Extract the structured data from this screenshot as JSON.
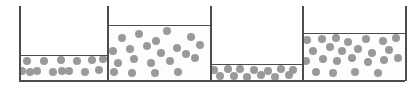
{
  "figure": {
    "title": "",
    "width": 418,
    "height": 88,
    "background_color": "#ffffff",
    "line_color": "#4d4d4d",
    "particle_color": "#9a9a9a",
    "particle_diameter": 8,
    "baseline_y": 80,
    "top_y": 6
  },
  "containers": [
    {
      "label": "container-1",
      "index": 1,
      "left_x": 19,
      "right_x": 107,
      "fill_level_y": 55,
      "fill_fraction": 0.34,
      "particle_count": 14,
      "particles": [
        {
          "x": 27,
          "y": 60
        },
        {
          "x": 44,
          "y": 60
        },
        {
          "x": 61,
          "y": 59
        },
        {
          "x": 77,
          "y": 60
        },
        {
          "x": 92,
          "y": 59
        },
        {
          "x": 103,
          "y": 58
        },
        {
          "x": 22,
          "y": 70
        },
        {
          "x": 37,
          "y": 70
        },
        {
          "x": 53,
          "y": 71
        },
        {
          "x": 69,
          "y": 70
        },
        {
          "x": 85,
          "y": 71
        },
        {
          "x": 99,
          "y": 69
        },
        {
          "x": 62,
          "y": 70
        },
        {
          "x": 30,
          "y": 71
        }
      ]
    },
    {
      "label": "container-2",
      "index": 2,
      "left_x": 107,
      "right_x": 210,
      "fill_level_y": 25,
      "fill_fraction": 0.68,
      "particle_count": 21,
      "particles": [
        {
          "x": 122,
          "y": 37
        },
        {
          "x": 139,
          "y": 33
        },
        {
          "x": 156,
          "y": 40
        },
        {
          "x": 167,
          "y": 30
        },
        {
          "x": 191,
          "y": 36
        },
        {
          "x": 200,
          "y": 44
        },
        {
          "x": 113,
          "y": 50
        },
        {
          "x": 130,
          "y": 48
        },
        {
          "x": 147,
          "y": 45
        },
        {
          "x": 161,
          "y": 52
        },
        {
          "x": 177,
          "y": 47
        },
        {
          "x": 195,
          "y": 57
        },
        {
          "x": 118,
          "y": 62
        },
        {
          "x": 134,
          "y": 58
        },
        {
          "x": 151,
          "y": 62
        },
        {
          "x": 170,
          "y": 60
        },
        {
          "x": 186,
          "y": 53
        },
        {
          "x": 114,
          "y": 71
        },
        {
          "x": 132,
          "y": 72
        },
        {
          "x": 155,
          "y": 72
        },
        {
          "x": 178,
          "y": 71
        }
      ]
    },
    {
      "label": "container-3",
      "index": 3,
      "left_x": 210,
      "right_x": 302,
      "fill_level_y": 64,
      "fill_fraction": 0.22,
      "particle_count": 13,
      "particles": [
        {
          "x": 214,
          "y": 69
        },
        {
          "x": 228,
          "y": 68
        },
        {
          "x": 240,
          "y": 68
        },
        {
          "x": 254,
          "y": 69
        },
        {
          "x": 268,
          "y": 70
        },
        {
          "x": 281,
          "y": 68
        },
        {
          "x": 293,
          "y": 69
        },
        {
          "x": 234,
          "y": 75
        },
        {
          "x": 247,
          "y": 76
        },
        {
          "x": 261,
          "y": 74
        },
        {
          "x": 275,
          "y": 76
        },
        {
          "x": 289,
          "y": 74
        },
        {
          "x": 220,
          "y": 75
        }
      ]
    },
    {
      "label": "container-4",
      "index": 4,
      "left_x": 302,
      "right_x": 405,
      "fill_level_y": 33,
      "fill_fraction": 0.58,
      "particle_count": 24,
      "particles": [
        {
          "x": 307,
          "y": 39
        },
        {
          "x": 322,
          "y": 38
        },
        {
          "x": 336,
          "y": 37
        },
        {
          "x": 348,
          "y": 41
        },
        {
          "x": 366,
          "y": 38
        },
        {
          "x": 383,
          "y": 40
        },
        {
          "x": 396,
          "y": 37
        },
        {
          "x": 313,
          "y": 50
        },
        {
          "x": 330,
          "y": 46
        },
        {
          "x": 342,
          "y": 50
        },
        {
          "x": 358,
          "y": 48
        },
        {
          "x": 372,
          "y": 52
        },
        {
          "x": 389,
          "y": 49
        },
        {
          "x": 306,
          "y": 60
        },
        {
          "x": 323,
          "y": 58
        },
        {
          "x": 337,
          "y": 60
        },
        {
          "x": 352,
          "y": 57
        },
        {
          "x": 368,
          "y": 61
        },
        {
          "x": 384,
          "y": 59
        },
        {
          "x": 398,
          "y": 57
        },
        {
          "x": 316,
          "y": 71
        },
        {
          "x": 333,
          "y": 72
        },
        {
          "x": 355,
          "y": 71
        },
        {
          "x": 378,
          "y": 72
        }
      ]
    }
  ],
  "walls": [
    {
      "name": "left-outer-wall",
      "x": 19,
      "top_y": 6,
      "bottom_y": 81
    },
    {
      "name": "divider-wall-1-2",
      "x": 107,
      "top_y": 6,
      "bottom_y": 81
    },
    {
      "name": "divider-wall-2-3",
      "x": 210,
      "top_y": 6,
      "bottom_y": 81
    },
    {
      "name": "divider-wall-3-4",
      "x": 302,
      "top_y": 6,
      "bottom_y": 81
    },
    {
      "name": "right-outer-wall",
      "x": 405,
      "top_y": 6,
      "bottom_y": 81
    }
  ]
}
